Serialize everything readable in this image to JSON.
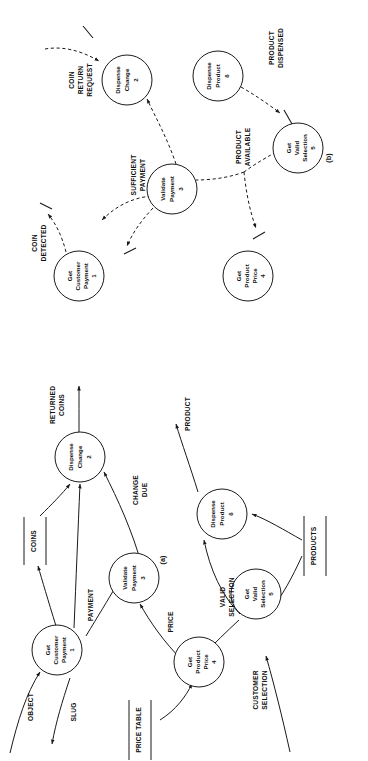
{
  "figure": {
    "type": "data-flow-diagram",
    "orientation": "rotated-90-ccw",
    "parts": [
      {
        "id": "a",
        "label": "(a)",
        "caption": "Data flow diagram"
      },
      {
        "id": "b",
        "label": "(b)",
        "caption": "Control flow diagram"
      }
    ]
  },
  "diagram_a": {
    "label": "(a)",
    "processes": [
      {
        "id": "p1",
        "name": "Get\nCustomer\nPayment",
        "line1": "Get",
        "line2": "Customer",
        "line3": "Payment",
        "number": "1"
      },
      {
        "id": "p2",
        "name": "Dispense\nChange",
        "line1": "Dispense",
        "line2": "Change",
        "line3": "",
        "number": "2"
      },
      {
        "id": "p3",
        "name": "Validate\nPayment",
        "line1": "Validate",
        "line2": "Payment",
        "line3": "",
        "number": "3"
      },
      {
        "id": "p4",
        "name": "Get\nProduct\nPrice",
        "line1": "Get",
        "line2": "Product",
        "line3": "Price",
        "number": "4"
      },
      {
        "id": "p5",
        "name": "Get\nValid\nSelection",
        "line1": "Get",
        "line2": "Valid",
        "line3": "Selection",
        "number": "5"
      },
      {
        "id": "p6",
        "name": "Dispense\nProduct",
        "line1": "Dispense",
        "line2": "Product",
        "line3": "",
        "number": "6"
      }
    ],
    "stores": [
      {
        "id": "s1",
        "label": "COINS"
      },
      {
        "id": "s2",
        "label": "PRICE TABLE"
      },
      {
        "id": "s3",
        "label": "PRODUCTS"
      }
    ],
    "flows": [
      {
        "id": "f1",
        "label": "OBJECT",
        "line1": "OBJECT",
        "line2": ""
      },
      {
        "id": "f2",
        "label": "SLUG",
        "line1": "SLUG",
        "line2": ""
      },
      {
        "id": "f3",
        "label": "PAYMENT",
        "line1": "PAYMENT",
        "line2": ""
      },
      {
        "id": "f4",
        "label": "RETURNED COINS",
        "line1": "RETURNED",
        "line2": "COINS"
      },
      {
        "id": "f5",
        "label": "CHANGE DUE",
        "line1": "CHANGE",
        "line2": "DUE"
      },
      {
        "id": "f6",
        "label": "PRICE",
        "line1": "PRICE",
        "line2": ""
      },
      {
        "id": "f7",
        "label": "VALID SELECTION",
        "line1": "VALID",
        "line2": "SELECTION"
      },
      {
        "id": "f8",
        "label": "CUSTOMER SELECTION",
        "line1": "CUSTOMER",
        "line2": "SELECTION"
      },
      {
        "id": "f9",
        "label": "PRODUCT",
        "line1": "PRODUCT",
        "line2": ""
      }
    ]
  },
  "diagram_b": {
    "label": "(b)",
    "processes": [
      {
        "id": "p1",
        "name": "Get\nCustomer\nPayment",
        "line1": "Get",
        "line2": "Customer",
        "line3": "Payment",
        "number": "1"
      },
      {
        "id": "p2",
        "name": "Dispense\nChange",
        "line1": "Dispense",
        "line2": "Change",
        "line3": "",
        "number": "2"
      },
      {
        "id": "p3",
        "name": "Validate\nPayment",
        "line1": "Validate",
        "line2": "Payment",
        "line3": "",
        "number": "3"
      },
      {
        "id": "p4",
        "name": "Get\nProduct\nPrice",
        "line1": "Get",
        "line2": "Product",
        "line3": "Price",
        "number": "4"
      },
      {
        "id": "p5",
        "name": "Get\nValid\nSelection",
        "line1": "Get",
        "line2": "Valid",
        "line3": "Selection",
        "number": "5"
      },
      {
        "id": "p6",
        "name": "Dispense\nProduct",
        "line1": "Dispense",
        "line2": "Product",
        "line3": "",
        "number": "6"
      }
    ],
    "flows": [
      {
        "id": "c1",
        "label": "COIN DETECTED",
        "line1": "COIN",
        "line2": "DETECTED"
      },
      {
        "id": "c2",
        "label": "COIN RETURN REQUEST",
        "line1": "COIN",
        "line2": "RETURN",
        "line3": "REQUEST"
      },
      {
        "id": "c3",
        "label": "SUFFICIENT PAYMENT",
        "line1": "SUFFICIENT",
        "line2": "PAYMENT"
      },
      {
        "id": "c4",
        "label": "PRODUCT AVAILABLE",
        "line1": "PRODUCT",
        "line2": "AVAILABLE"
      },
      {
        "id": "c5",
        "label": "PRODUCT DISPENSED",
        "line1": "PRODUCT",
        "line2": "DISPENSED"
      }
    ]
  },
  "colors": {
    "ink": "#1a1a1a",
    "paper": "#ffffff"
  }
}
